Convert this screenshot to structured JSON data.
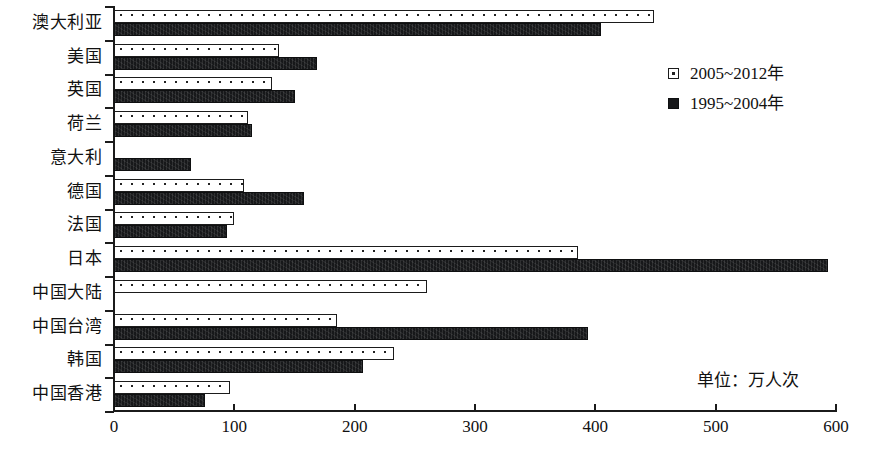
{
  "chart_data": {
    "type": "bar",
    "orientation": "horizontal",
    "title": "",
    "xlabel": "",
    "ylabel": "",
    "xlim": [
      0,
      600
    ],
    "xticks": [
      0,
      100,
      200,
      300,
      400,
      500,
      600
    ],
    "grid": false,
    "legend_position": "top-right",
    "unit_note": "单位：万人次",
    "categories": [
      "澳大利亚",
      "美国",
      "英国",
      "荷兰",
      "意大利",
      "德国",
      "法国",
      "日本",
      "中国大陆",
      "中国台湾",
      "韩国",
      "中国香港"
    ],
    "series": [
      {
        "name": "2005~2012年",
        "style": "light-dotted",
        "color": "#ffffff",
        "values": [
          449,
          137,
          131,
          111,
          0,
          108,
          100,
          386,
          260,
          185,
          233,
          96
        ]
      },
      {
        "name": "1995~2004年",
        "style": "solid-dark",
        "color": "#17181a",
        "values": [
          405,
          169,
          150,
          115,
          64,
          158,
          94,
          593,
          0,
          394,
          207,
          76
        ]
      }
    ]
  },
  "legend": {
    "items": [
      {
        "label": "2005~2012年",
        "swatch": "light-dotted-swatch"
      },
      {
        "label": "1995~2004年",
        "swatch": "solid-dark-swatch"
      }
    ]
  },
  "axis": {
    "x_tick_labels": [
      "0",
      "100",
      "200",
      "300",
      "400",
      "500",
      "600"
    ]
  }
}
